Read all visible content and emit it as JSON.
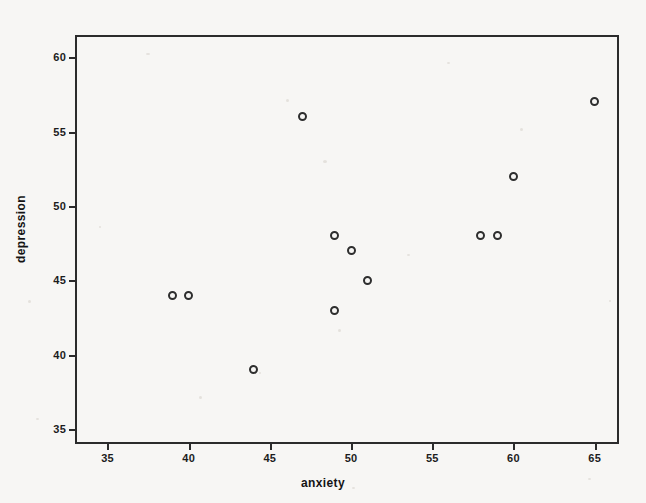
{
  "chart_data": {
    "type": "scatter",
    "title": "",
    "xlabel": "anxiety",
    "ylabel": "depression",
    "xlim": [
      33,
      66.5
    ],
    "ylim": [
      34,
      61.5
    ],
    "xticks": [
      35,
      40,
      45,
      50,
      55,
      60,
      65
    ],
    "yticks": [
      35,
      40,
      45,
      50,
      55,
      60
    ],
    "grid": false,
    "legend": null,
    "marker": "open-circle",
    "marker_color": "#2e2e2e",
    "points": [
      {
        "x": 39,
        "y": 44
      },
      {
        "x": 40,
        "y": 44
      },
      {
        "x": 44,
        "y": 39
      },
      {
        "x": 47,
        "y": 56
      },
      {
        "x": 49,
        "y": 48
      },
      {
        "x": 49,
        "y": 43
      },
      {
        "x": 50,
        "y": 47
      },
      {
        "x": 51,
        "y": 45
      },
      {
        "x": 58,
        "y": 48
      },
      {
        "x": 59,
        "y": 48
      },
      {
        "x": 60,
        "y": 52
      },
      {
        "x": 65,
        "y": 57
      }
    ]
  },
  "style": {
    "background": "#f7f6f4",
    "axis_color": "#2b2b2b",
    "text_color": "#1c1c1c"
  }
}
